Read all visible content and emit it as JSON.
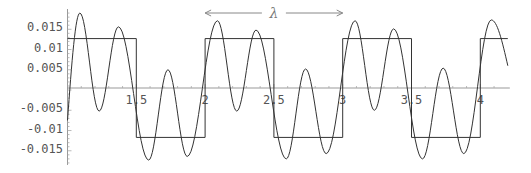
{
  "chart_data": {
    "type": "line",
    "title": "",
    "xlabel": "",
    "ylabel": "",
    "xlim": [
      1.0,
      4.2
    ],
    "ylim": [
      -0.019,
      0.0195
    ],
    "grid": false,
    "legend": null,
    "x_ticks": [
      "1.5",
      "2",
      "2.5",
      "3",
      "3.5",
      "4"
    ],
    "x_tick_values": [
      1.5,
      2,
      2.5,
      3,
      3.5,
      4
    ],
    "y_ticks": [
      "0.015",
      "0.01",
      "0.005",
      "-0.005",
      "-0.01",
      "-0.015"
    ],
    "y_tick_values": [
      0.015,
      0.01,
      0.005,
      -0.005,
      -0.01,
      -0.015
    ],
    "annotation": {
      "text": "λ",
      "x_from": 2.0,
      "x_to": 3.0,
      "y": 0.0183,
      "style": "double-arrow"
    },
    "series": [
      {
        "name": "square-wave",
        "kind": "step",
        "amplitude": 0.0122,
        "period": 1.0,
        "x_start": 1.0,
        "x_end": 4.2,
        "transitions": [
          1.5,
          2.0,
          2.5,
          3.0,
          3.5,
          4.0
        ],
        "values": [
          0.0122,
          -0.0122,
          0.0122,
          -0.0122,
          0.0122,
          -0.0122,
          0.0122
        ]
      },
      {
        "name": "oscillating-wave",
        "kind": "curve",
        "x_start": 1.0,
        "x_end": 4.2,
        "peaks": [
          {
            "x": 1.09,
            "y": 0.0185
          },
          {
            "x": 1.23,
            "y": -0.0057
          },
          {
            "x": 1.37,
            "y": 0.0151
          },
          {
            "x": 1.59,
            "y": -0.0178
          },
          {
            "x": 1.73,
            "y": 0.0045
          },
          {
            "x": 1.87,
            "y": -0.0169
          },
          {
            "x": 2.09,
            "y": 0.0166
          },
          {
            "x": 2.23,
            "y": -0.0057
          },
          {
            "x": 2.37,
            "y": 0.0143
          },
          {
            "x": 2.59,
            "y": -0.0175
          },
          {
            "x": 2.73,
            "y": 0.0047
          },
          {
            "x": 2.88,
            "y": -0.0162
          },
          {
            "x": 3.09,
            "y": 0.0166
          },
          {
            "x": 3.23,
            "y": -0.0055
          },
          {
            "x": 3.37,
            "y": 0.0146
          },
          {
            "x": 3.58,
            "y": -0.0175
          },
          {
            "x": 3.73,
            "y": 0.0049
          },
          {
            "x": 3.88,
            "y": -0.0162
          },
          {
            "x": 4.08,
            "y": 0.0168
          }
        ],
        "start": {
          "x": 1.0,
          "y": -0.008
        },
        "end": {
          "x": 4.2,
          "y": 0.0055
        }
      }
    ]
  }
}
